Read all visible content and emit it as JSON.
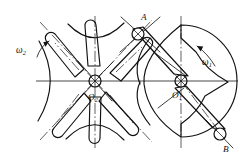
{
  "figure": {
    "kind": "geneva-mechanism-diagram",
    "stroke_color": "#111111",
    "background_color": "#ffffff"
  },
  "labels": {
    "omega1": "ω",
    "omega1_sub": "1",
    "omega2": "ω",
    "omega2_sub": "2",
    "center_o1": "O",
    "center_o1_sub": "1",
    "center_o2": "O",
    "center_o2_sub": "2",
    "point_a": "A",
    "point_b": "B"
  },
  "geometry": {
    "driver_center": {
      "name": "O1",
      "x": 181,
      "y": 81
    },
    "driven_center": {
      "name": "O2",
      "x": 95,
      "y": 81
    },
    "pin_a": {
      "name": "A",
      "x": 138,
      "y": 34,
      "radius": 6
    },
    "pin_b": {
      "name": "B",
      "x": 220,
      "y": 134,
      "radius": 6
    },
    "driven_slot_count": 6,
    "driver_radius": 56,
    "driven_radius": 58,
    "center_distance": 86
  },
  "annotations": {
    "omega1_note": "driver angular velocity, counter-clockwise arrow at right",
    "omega2_note": "driven wheel angular velocity, arrow at left"
  }
}
